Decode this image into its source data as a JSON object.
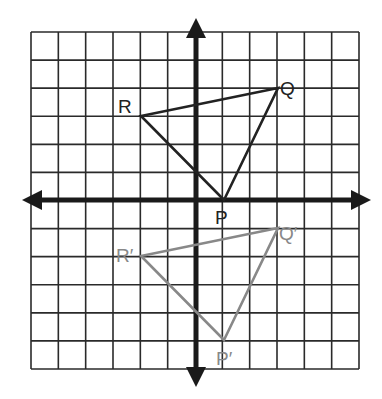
{
  "diagram": {
    "type": "coordinate-grid-reflection",
    "grid": {
      "xmin": -6,
      "xmax": 6,
      "ymin": -6,
      "ymax": 6
    },
    "original": {
      "color": "#222222",
      "points": [
        {
          "label": "P",
          "x": 1,
          "y": 0
        },
        {
          "label": "Q",
          "x": 3,
          "y": 4
        },
        {
          "label": "R",
          "x": -2,
          "y": 3
        }
      ]
    },
    "image": {
      "color": "#888888",
      "points": [
        {
          "label": "P′",
          "x": 1,
          "y": -5
        },
        {
          "label": "Q′",
          "x": 3,
          "y": -1
        },
        {
          "label": "R′",
          "x": -2,
          "y": -2
        }
      ]
    }
  },
  "labels": {
    "P": "P",
    "Q": "Q",
    "R": "R",
    "P_prime": "P′",
    "Q_prime": "Q′",
    "R_prime": "R′"
  }
}
